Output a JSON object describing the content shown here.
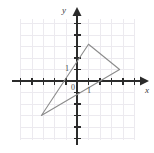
{
  "figure": {
    "kind": "coordinate-plane-with-triangle",
    "background_color": "#ffffff"
  },
  "chart_data": {
    "type": "scatter",
    "title": "",
    "xlabel": "x",
    "ylabel": "y",
    "grid": true,
    "legend": false,
    "xlim": [
      -5,
      5
    ],
    "ylim": [
      -5.5,
      5.5
    ],
    "x_tick_values": [
      -5,
      -4,
      -3,
      -2,
      -1,
      1,
      2,
      3,
      4,
      5
    ],
    "y_tick_values": [
      -5,
      -4,
      -3,
      -2,
      -1,
      1,
      2,
      3,
      4,
      5
    ],
    "origin_label": "0",
    "x_unit_label": "1",
    "y_unit_label": "1",
    "shapes": [
      {
        "name": "triangle",
        "type": "polygon",
        "closed": true,
        "stroke": "#8c8c8c",
        "fill": "none",
        "vertices": [
          {
            "label": "top",
            "x": 1.0,
            "y": 3.2
          },
          {
            "label": "right",
            "x": 3.7,
            "y": 1.0
          },
          {
            "label": "bottom-left",
            "x": -3.1,
            "y": -3.0
          }
        ]
      }
    ]
  },
  "colors": {
    "grid_line": "#eceaef",
    "axis_line": "#2b2b2b",
    "shape_stroke": "#8f8f8f",
    "label_text": "#3a3a3a"
  },
  "geometry": {
    "origin_px": {
      "x": 77,
      "y": 81
    },
    "unit_px": 11.5,
    "grid_bounds_px": {
      "left": 20.5,
      "right": 134.5,
      "top": 18.5,
      "bottom": 139.5
    }
  },
  "labels": {
    "y_axis": "y",
    "x_axis": "x",
    "origin": "0",
    "y_one": "1",
    "x_one": "1"
  }
}
